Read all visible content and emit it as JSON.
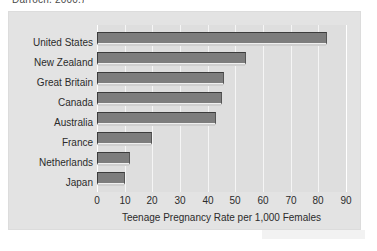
{
  "citation": "Darroch, 2000.)",
  "chart_data": {
    "type": "bar",
    "orientation": "horizontal",
    "title": "",
    "xlabel": "Teenage Pregnancy Rate per 1,000 Females",
    "ylabel": "",
    "categories": [
      "United States",
      "New Zealand",
      "Great Britain",
      "Canada",
      "Australia",
      "France",
      "Netherlands",
      "Japan"
    ],
    "values": [
      83,
      54,
      46,
      45,
      43,
      20,
      12,
      10
    ],
    "xlim": [
      0,
      90
    ],
    "xticks": [
      0,
      10,
      20,
      30,
      40,
      50,
      60,
      70,
      80,
      90
    ],
    "xtick_labels": [
      "0",
      "10",
      "20",
      "30",
      "40",
      "50",
      "60",
      "70",
      "80",
      "90"
    ],
    "grid": true,
    "grid_axis": "x",
    "legend": false,
    "series": [
      {
        "name": "Teenage Pregnancy Rate",
        "values": [
          83,
          54,
          46,
          45,
          43,
          20,
          12,
          10
        ]
      }
    ],
    "colors": {
      "bar_fill": "#7d7d7d",
      "bar_edge": "#3c3c3c",
      "plot_background": "#dedede",
      "figure_background": "#e3e3e3",
      "gridline": "#f5f5f5",
      "text": "#2b2b2b"
    }
  }
}
